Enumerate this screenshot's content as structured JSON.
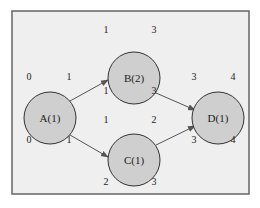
{
  "colors": {
    "page_bg": "#ffffff",
    "frame_bg": "#efefef",
    "frame_border": "#666666",
    "node_fill": "#cfcfcf",
    "node_stroke": "#333333",
    "edge": "#555555",
    "text": "#222222"
  },
  "frame": {
    "x": 12,
    "y": 11,
    "w": 237,
    "h": 183
  },
  "nodes": [
    {
      "id": "A",
      "label": "A(1)",
      "cx": 50,
      "cy": 118,
      "r": 26,
      "earliest_start": "0",
      "earliest_finish": "1",
      "latest_start": "0",
      "latest_finish": "1"
    },
    {
      "id": "B",
      "label": "B(2)",
      "cx": 134,
      "cy": 78,
      "r": 26,
      "earliest_start": "1",
      "earliest_finish": "3",
      "latest_start": "1",
      "latest_finish": "3"
    },
    {
      "id": "C",
      "label": "C(1)",
      "cx": 134,
      "cy": 160,
      "r": 26,
      "earliest_start": "1",
      "earliest_finish": "2",
      "latest_start": "2",
      "latest_finish": "3"
    },
    {
      "id": "D",
      "label": "D(1)",
      "cx": 218,
      "cy": 118,
      "r": 26,
      "earliest_start": "3",
      "earliest_finish": "4",
      "latest_start": "3",
      "latest_finish": "4"
    }
  ],
  "edges": [
    {
      "from": "A",
      "to": "B",
      "x1": 70,
      "y1": 101,
      "x2": 108,
      "y2": 80
    },
    {
      "from": "A",
      "to": "C",
      "x1": 70,
      "y1": 135,
      "x2": 108,
      "y2": 157
    },
    {
      "from": "B",
      "to": "D",
      "x1": 156,
      "y1": 93,
      "x2": 195,
      "y2": 110
    },
    {
      "from": "C",
      "to": "D",
      "x1": 156,
      "y1": 145,
      "x2": 195,
      "y2": 126
    }
  ]
}
